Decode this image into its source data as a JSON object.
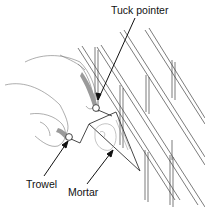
{
  "diagram": {
    "labels": {
      "tuck_pointer": "Tuck pointer",
      "trowel": "Trowel",
      "mortar": "Mortar"
    },
    "colors": {
      "line": "#333333",
      "tool_shade": "#9a9a9a",
      "background": "#ffffff"
    }
  }
}
